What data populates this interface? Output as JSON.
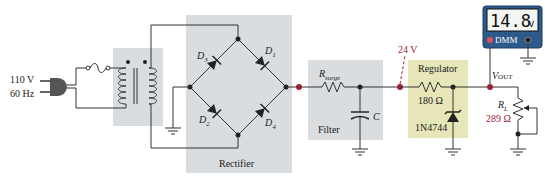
{
  "source": {
    "voltage": "110 V",
    "frequency": "60 Hz"
  },
  "blocks": {
    "rectifier": {
      "label": "Rectifier",
      "diodes": [
        "D",
        "D",
        "D",
        "D"
      ],
      "diode_subs": [
        "3",
        "1",
        "2",
        "4"
      ]
    },
    "filter": {
      "label": "Filter",
      "resistor_main": "R",
      "resistor_sub": "surge",
      "capacitor": "C"
    },
    "regulator": {
      "label": "Regulator",
      "resistor_value": "180 Ω",
      "zener_part": "1N4744"
    }
  },
  "test_point": {
    "label": "24 V"
  },
  "output": {
    "label_main": "V",
    "label_sub": "OUT",
    "load_main": "R",
    "load_sub": "L",
    "load_value": "289 Ω"
  },
  "dmm": {
    "reading": "14.8",
    "unit": "v",
    "label": "DMM"
  },
  "colors": {
    "block_gray": "#d9dde0",
    "block_yellow": "#e6e6b8",
    "accent_red": "#9b2335",
    "dmm_body": "#2d5a8a",
    "dmm_screen": "#f4f6f4"
  }
}
